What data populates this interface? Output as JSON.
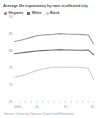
{
  "chart_data": {
    "type": "line",
    "title": "Average life expectancy by race in affected city",
    "xlabel": "",
    "ylabel": "",
    "x": [
      2006,
      2007,
      2008,
      2009,
      2010,
      2011,
      2012,
      2013,
      2014,
      2015,
      2016,
      2017,
      2018,
      2019,
      2020
    ],
    "xlim": [
      2006,
      2020
    ],
    "ylim": [
      65,
      90
    ],
    "yticks": [
      65,
      70,
      75,
      80,
      85,
      90
    ],
    "ytick_labels": [
      "65",
      "70",
      "75",
      "80",
      "85",
      "90"
    ],
    "xticks": [
      2006,
      2010,
      2015,
      2020
    ],
    "xtick_labels": [
      "2006",
      "10",
      "15",
      "20"
    ],
    "grid": false,
    "legend_position": "top-left",
    "series": [
      {
        "name": "Hispanic",
        "color": "#9a9b9d",
        "values": [
          83.1,
          83.4,
          83.8,
          84.3,
          84.8,
          85.0,
          85.1,
          85.2,
          85.4,
          85.3,
          85.2,
          85.2,
          85.1,
          85.0,
          82.3
        ]
      },
      {
        "name": "White",
        "color": "#6e6f71",
        "values": [
          79.5,
          79.7,
          79.9,
          80.1,
          80.3,
          80.4,
          80.5,
          80.6,
          80.7,
          80.6,
          80.6,
          80.5,
          80.5,
          80.6,
          79.1
        ]
      },
      {
        "name": "Black",
        "color": "#cfd0d2",
        "values": [
          72.4,
          72.9,
          73.4,
          74.0,
          74.6,
          75.0,
          75.3,
          75.5,
          75.6,
          75.5,
          75.6,
          75.5,
          75.4,
          75.2,
          71.8
        ]
      }
    ]
  },
  "legend": {
    "items": [
      {
        "label": "Hispanic",
        "color": "#9a9b9d"
      },
      {
        "label": "White",
        "color": "#6e6f71"
      },
      {
        "label": "Black",
        "color": "#cfd0d2"
      }
    ]
  },
  "source": {
    "text": "Source: Center for Disease Control and Prevention"
  }
}
